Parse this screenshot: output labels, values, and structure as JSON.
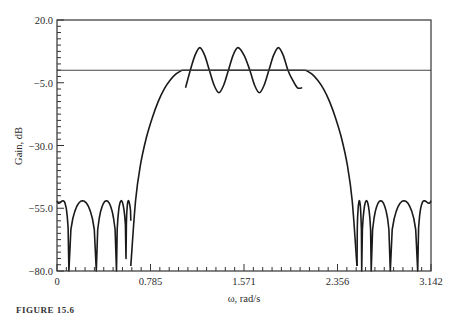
{
  "chart_data": {
    "type": "line",
    "title": "",
    "xlabel": "ω, rad/s",
    "ylabel": "Gain, dB",
    "xlim": [
      0,
      3.142
    ],
    "ylim": [
      -80,
      20
    ],
    "xticks": [
      0,
      0.785,
      1.571,
      2.356,
      3.142
    ],
    "xtick_labels": [
      "0",
      "0.785",
      "1.571",
      "2.356",
      "3.142"
    ],
    "yticks": [
      20,
      -5,
      -30,
      -55,
      -80
    ],
    "ytick_labels": [
      "20.0",
      "−5.0",
      "−30.0",
      "−55.0",
      "−80.0"
    ],
    "grid": false,
    "legend": null,
    "reference_line": {
      "y": 0,
      "label": "0 dB reference"
    },
    "series": [
      {
        "name": "bandpass filter gain (outer envelope)",
        "x": [
          0.62,
          0.66,
          0.7,
          0.75,
          0.8,
          0.85,
          0.9,
          0.95,
          1.0,
          1.05,
          2.09,
          2.14,
          2.19,
          2.24,
          2.29,
          2.34,
          2.39,
          2.44,
          2.48,
          2.52
        ],
        "y": [
          -78,
          -52,
          -38,
          -27,
          -19,
          -12.5,
          -7.5,
          -4,
          -1.5,
          0,
          0,
          -1.5,
          -4,
          -7.5,
          -12.5,
          -19,
          -27,
          -38,
          -52,
          -78
        ]
      },
      {
        "name": "passband ripple",
        "x": [
          1.08,
          1.12,
          1.16,
          1.2,
          1.24,
          1.28,
          1.32,
          1.36,
          1.4,
          1.44,
          1.48,
          1.52,
          1.571,
          1.62,
          1.66,
          1.7,
          1.74,
          1.78,
          1.82,
          1.86,
          1.9,
          1.94,
          1.98,
          2.02,
          2.06
        ],
        "y": [
          -7,
          0,
          6,
          9,
          6,
          0,
          -6,
          -9,
          -6,
          0,
          6,
          9,
          6,
          0,
          -6,
          -9,
          -6,
          0,
          6,
          9,
          6,
          0,
          -4,
          -7,
          -7
        ]
      },
      {
        "name": "lower stopband lobes",
        "lobe_peaks_db": -52,
        "nulls_x": [
          0.1,
          0.33,
          0.5,
          0.58,
          0.62
        ],
        "null_depths_db": [
          -80,
          -80,
          -80,
          -75,
          -60
        ]
      },
      {
        "name": "upper stopband lobes",
        "lobe_peaks_db": -52,
        "nulls_x": [
          2.52,
          2.56,
          2.64,
          2.8,
          3.03
        ],
        "null_depths_db": [
          -78,
          -80,
          -80,
          -80,
          -80
        ]
      }
    ]
  },
  "caption": "FIGURE 15.6"
}
